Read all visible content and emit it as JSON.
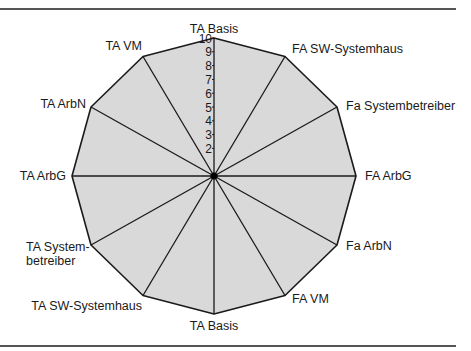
{
  "chart_data": {
    "type": "radar",
    "title": "",
    "center": [
      214,
      176
    ],
    "radius": [
      142,
      138
    ],
    "scale": {
      "min": 0,
      "max": 10,
      "tick_labels": [
        "1",
        "2",
        "3",
        "4",
        "5",
        "6",
        "7",
        "8",
        "9",
        "10"
      ],
      "visible_ticks": [
        2,
        3,
        4,
        5,
        6,
        7,
        8,
        9,
        10
      ]
    },
    "axes": [
      {
        "label": "TA Basis",
        "lines": [
          "TA Basis"
        ]
      },
      {
        "label": "FA SW-Systemhaus",
        "lines": [
          "FA SW-Systemhaus"
        ]
      },
      {
        "label": "Fa Systembetreiber",
        "lines": [
          "Fa Systembetreiber"
        ]
      },
      {
        "label": "FA ArbG",
        "lines": [
          "FA ArbG"
        ]
      },
      {
        "label": "Fa ArbN",
        "lines": [
          "Fa ArbN"
        ]
      },
      {
        "label": "FA VM",
        "lines": [
          "FA VM"
        ]
      },
      {
        "label": "TA Basis",
        "lines": [
          "TA Basis"
        ]
      },
      {
        "label": "TA SW-Systemhaus",
        "lines": [
          "TA SW-Systemhaus"
        ]
      },
      {
        "label": "TA Systembetreiber",
        "lines": [
          "TA System-",
          "betreiber"
        ]
      },
      {
        "label": "TA ArbG",
        "lines": [
          "TA ArbG"
        ]
      },
      {
        "label": "TA ArbN",
        "lines": [
          "TA ArbN"
        ]
      },
      {
        "label": "TA VM",
        "lines": [
          "TA VM"
        ]
      }
    ],
    "series": [
      {
        "name": "",
        "values": [
          10,
          10,
          10,
          10,
          10,
          10,
          10,
          10,
          10,
          10,
          10,
          10
        ]
      }
    ],
    "fill_color": "#d9d9d9",
    "line_color": "#1a1a1a",
    "grid": false,
    "legend": "none"
  }
}
